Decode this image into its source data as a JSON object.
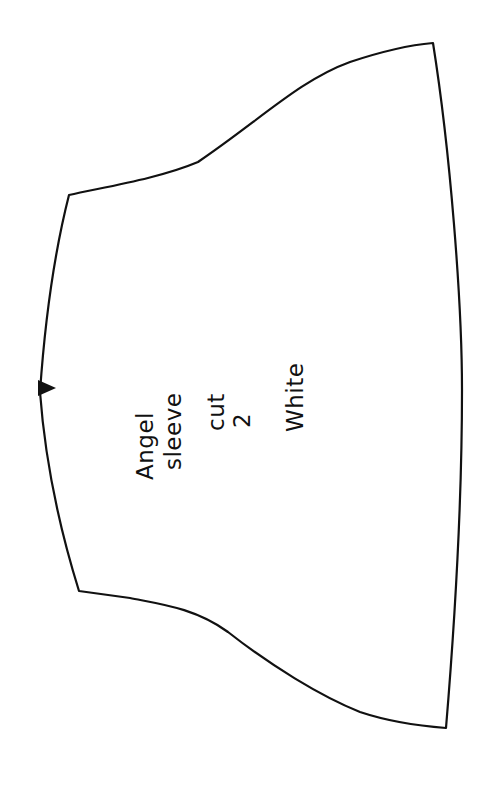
{
  "pattern": {
    "name": "Angel sleeve pattern piece",
    "stroke_color": "#111111",
    "background": "#ffffff",
    "notch": "triangle-notch",
    "labels": {
      "line1": "Angel",
      "line2": "sleeve",
      "line3": "cut",
      "line4": "2",
      "line5": "White"
    }
  }
}
